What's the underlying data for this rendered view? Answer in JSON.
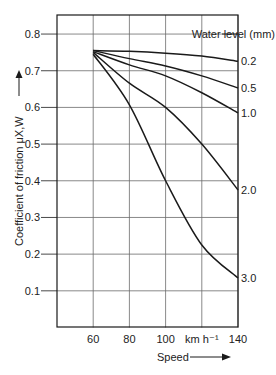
{
  "chart_data": {
    "type": "line",
    "title": "",
    "xlabel": "Speed",
    "x_unit": "km h⁻¹",
    "ylabel": "Coefficient of friction μX,W",
    "xlim": [
      40,
      140
    ],
    "ylim": [
      0.0,
      0.85
    ],
    "grid": true,
    "x_ticks": [
      60,
      80,
      100,
      120,
      140
    ],
    "x_tick_labels": [
      "60",
      "80",
      "100",
      "km h⁻¹",
      "140"
    ],
    "y_ticks": [
      0.1,
      0.2,
      0.3,
      0.4,
      0.5,
      0.6,
      0.7,
      0.8
    ],
    "y_tick_labels": [
      "0.1",
      "0.2",
      "0.3",
      "0.4",
      "0.5",
      "0.6",
      "0.7",
      "0.8"
    ],
    "legend_title": "Water level (mm)",
    "legend_position": "right, labels at line ends",
    "x": [
      60,
      80,
      100,
      120,
      140
    ],
    "series": [
      {
        "name": "0.2",
        "values": [
          0.755,
          0.753,
          0.748,
          0.74,
          0.726
        ]
      },
      {
        "name": "0.5",
        "values": [
          0.755,
          0.733,
          0.713,
          0.686,
          0.653
        ]
      },
      {
        "name": "1.0",
        "values": [
          0.752,
          0.716,
          0.686,
          0.64,
          0.585
        ]
      },
      {
        "name": "2.0",
        "values": [
          0.75,
          0.666,
          0.6,
          0.5,
          0.375
        ]
      },
      {
        "name": "3.0",
        "values": [
          0.745,
          0.607,
          0.4,
          0.225,
          0.135
        ]
      }
    ],
    "colors": {
      "line": "#1a1a1a",
      "grid": "#6b6b6b",
      "axis": "#1a1a1a"
    }
  }
}
